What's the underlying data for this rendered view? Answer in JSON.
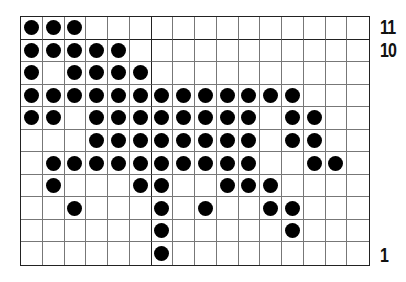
{
  "chart_grid": {
    "columns": 16,
    "rows": 11,
    "thick_vertical_after_column": 6,
    "thick_horizontal_below_row": 11,
    "dot_color": "#000000",
    "line_color": "#777777"
  },
  "row_labels": [
    {
      "row": 11,
      "text": "11"
    },
    {
      "row": 10,
      "text": "10"
    },
    {
      "row": 1,
      "text": "1"
    }
  ],
  "pattern": {
    "11": [
      1,
      2,
      3
    ],
    "10": [
      1,
      2,
      3,
      4,
      5
    ],
    "9": [
      1,
      3,
      4,
      5,
      6
    ],
    "8": [
      1,
      2,
      3,
      4,
      5,
      6,
      7,
      8,
      9,
      10,
      11,
      12,
      13
    ],
    "7": [
      1,
      2,
      4,
      5,
      6,
      7,
      8,
      9,
      10,
      11,
      13,
      14
    ],
    "6": [
      4,
      5,
      6,
      7,
      8,
      9,
      10,
      11,
      13,
      14
    ],
    "5": [
      2,
      3,
      4,
      5,
      6,
      7,
      8,
      9,
      10,
      11,
      14,
      15
    ],
    "4": [
      2,
      6,
      7,
      10,
      11,
      12
    ],
    "3": [
      3,
      7,
      9,
      12,
      13
    ],
    "2": [
      7,
      13
    ],
    "1": [
      7
    ]
  }
}
